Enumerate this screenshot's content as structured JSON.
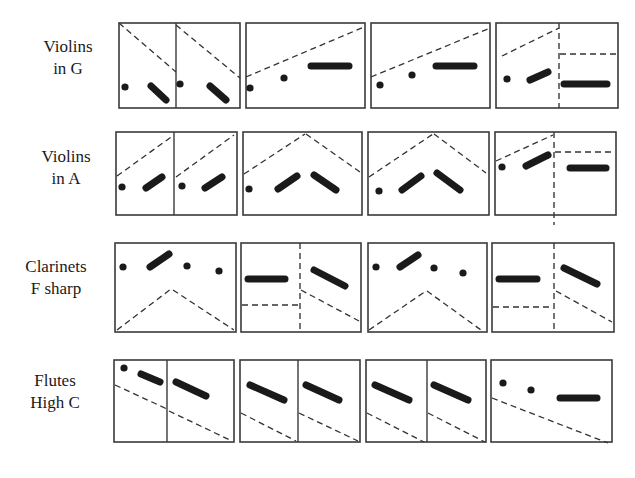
{
  "rows": [
    {
      "label_line1": "Violins",
      "label_line2": "in G",
      "label_y": 36,
      "y0": 23,
      "y1": 108,
      "panels": [
        {
          "x0": 119,
          "x1": 240,
          "dividers": [
            {
              "x": 176,
              "style": "solid"
            }
          ],
          "dashed": [
            [
              119,
              23,
              176,
              72
            ],
            [
              176,
              25,
              240,
              78
            ]
          ],
          "dots": [
            [
              125,
              87
            ],
            [
              180,
              84
            ]
          ],
          "bars": [
            [
              151,
              86,
              166,
              100
            ],
            [
              210,
              86,
              226,
              100
            ]
          ]
        },
        {
          "x0": 246,
          "x1": 365,
          "dividers": [],
          "dashed": [
            [
              246,
              77,
              364,
              27
            ]
          ],
          "dots": [
            [
              250,
              88
            ],
            [
              284,
              78
            ]
          ],
          "bars": [
            [
              311,
              66,
              349,
              66
            ]
          ]
        },
        {
          "x0": 371,
          "x1": 490,
          "dividers": [],
          "dashed": [
            [
              371,
              77,
              490,
              28
            ]
          ],
          "dots": [
            [
              380,
              85
            ],
            [
              412,
              75
            ]
          ],
          "bars": [
            [
              436,
              66,
              474,
              66
            ]
          ]
        },
        {
          "x0": 496,
          "x1": 618,
          "dividers": [
            {
              "x": 559,
              "style": "dashed"
            }
          ],
          "dashed": [
            [
              502,
              56,
              559,
              28
            ],
            [
              560,
              54,
              617,
              54
            ]
          ],
          "dots": [
            [
              507,
              79
            ]
          ],
          "bars": [
            [
              530,
              80,
              548,
              72
            ],
            [
              564,
              84,
              607,
              84
            ]
          ]
        }
      ]
    },
    {
      "label_line1": "Violins",
      "label_line2": "in A",
      "label_y": 146,
      "y0": 132,
      "y1": 215,
      "panels": [
        {
          "x0": 116,
          "x1": 237,
          "dividers": [
            {
              "x": 174,
              "style": "solid"
            }
          ],
          "dashed": [
            [
              117,
              176,
              174,
              135
            ],
            [
              176,
              177,
              234,
              135
            ]
          ],
          "dots": [
            [
              122,
              187
            ],
            [
              182,
              186
            ]
          ],
          "bars": [
            [
              146,
              188,
              162,
              177
            ],
            [
              205,
              188,
              222,
              177
            ]
          ]
        },
        {
          "x0": 243,
          "x1": 362,
          "dividers": [],
          "dashed": [
            [
              244,
              174,
              305,
              134
            ],
            [
              306,
              134,
              360,
              172
            ]
          ],
          "dots": [
            [
              249,
              189
            ]
          ],
          "bars": [
            [
              278,
              189,
              297,
              176
            ],
            [
              314,
              175,
              336,
              190
            ]
          ]
        },
        {
          "x0": 368,
          "x1": 489,
          "dividers": [],
          "dashed": [
            [
              369,
              177,
              433,
              134
            ],
            [
              434,
              134,
              486,
              173
            ]
          ],
          "dots": [
            [
              379,
              191
            ]
          ],
          "bars": [
            [
              402,
              190,
              421,
              176
            ],
            [
              437,
              173,
              460,
              190
            ]
          ]
        },
        {
          "x0": 495,
          "x1": 616,
          "dividers": [
            {
              "x": 554,
              "style": "dashed",
              "extend": true
            }
          ],
          "dashed": [
            [
              496,
              161,
              553,
              135
            ],
            [
              555,
              152,
              615,
              152
            ]
          ],
          "dots": [
            [
              502,
              167
            ]
          ],
          "bars": [
            [
              526,
              166,
              548,
              155
            ],
            [
              570,
              168,
              606,
              168
            ]
          ]
        }
      ]
    },
    {
      "label_line1": "Clarinets",
      "label_line2": "F sharp",
      "label_y": 256,
      "y0": 243,
      "y1": 332,
      "panels": [
        {
          "x0": 115,
          "x1": 236,
          "dividers": [],
          "dashed": [
            [
              117,
              330,
              171,
              289
            ],
            [
              173,
              290,
              234,
              330
            ]
          ],
          "dots": [
            [
              123,
              267
            ],
            [
              187,
              266
            ],
            [
              219,
              271
            ]
          ],
          "bars": [
            [
              150,
              267,
              169,
              254
            ]
          ]
        },
        {
          "x0": 241,
          "x1": 361,
          "dividers": [
            {
              "x": 300,
              "style": "dashed"
            }
          ],
          "dashed": [
            [
              242,
              305,
              298,
              305
            ],
            [
              301,
              290,
              359,
              321
            ]
          ],
          "bars": [
            [
              248,
              279,
              285,
              279
            ],
            [
              314,
              270,
              345,
              286
            ]
          ],
          "dots": []
        },
        {
          "x0": 368,
          "x1": 487,
          "dividers": [],
          "dashed": [
            [
              369,
              330,
              426,
              291
            ],
            [
              427,
              291,
              481,
              330
            ]
          ],
          "dots": [
            [
              376,
              267
            ],
            [
              434,
              268
            ],
            [
              463,
              273
            ]
          ],
          "bars": [
            [
              400,
              267,
              418,
              255
            ]
          ]
        },
        {
          "x0": 492,
          "x1": 614,
          "dividers": [
            {
              "x": 554,
              "style": "dashed"
            }
          ],
          "dashed": [
            [
              493,
              307,
              553,
              307
            ],
            [
              556,
              291,
              612,
              322
            ]
          ],
          "bars": [
            [
              499,
              279,
              537,
              279
            ],
            [
              564,
              268,
              597,
              284
            ]
          ],
          "dots": []
        }
      ]
    },
    {
      "label_line1": "Flutes",
      "label_line2": "High C",
      "label_y": 370,
      "y0": 360,
      "y1": 442,
      "panels": [
        {
          "x0": 114,
          "x1": 234,
          "dividers": [
            {
              "x": 167,
              "style": "solid"
            }
          ],
          "dashed": [
            [
              115,
              385,
              167,
              409
            ],
            [
              169,
              411,
              232,
              441
            ]
          ],
          "dots": [
            [
              124,
              368
            ]
          ],
          "bars": [
            [
              141,
              374,
              160,
              382
            ],
            [
              176,
              382,
              206,
              396
            ]
          ]
        },
        {
          "x0": 240,
          "x1": 360,
          "dividers": [
            {
              "x": 298,
              "style": "solid"
            }
          ],
          "dashed": [
            [
              241,
              413,
              296,
              441
            ],
            [
              299,
              413,
              358,
              441
            ]
          ],
          "bars": [
            [
              250,
              385,
              284,
              400
            ],
            [
              306,
              385,
              339,
              400
            ]
          ],
          "dots": []
        },
        {
          "x0": 366,
          "x1": 486,
          "dividers": [
            {
              "x": 427,
              "style": "solid"
            }
          ],
          "dashed": [
            [
              367,
              413,
              424,
              442
            ],
            [
              428,
              413,
              485,
              442
            ]
          ],
          "bars": [
            [
              375,
              385,
              409,
              400
            ],
            [
              434,
              385,
              468,
              400
            ]
          ],
          "dots": []
        },
        {
          "x0": 491,
          "x1": 612,
          "dividers": [],
          "dashed": [
            [
              492,
              398,
              608,
              443
            ]
          ],
          "dots": [
            [
              503,
              383
            ],
            [
              531,
              390
            ]
          ],
          "bars": [
            [
              560,
              398,
              597,
              398
            ]
          ]
        }
      ]
    }
  ],
  "colors": {
    "ink": "#1a1a1a",
    "frame": "#3a3a3a",
    "background": "#ffffff"
  }
}
